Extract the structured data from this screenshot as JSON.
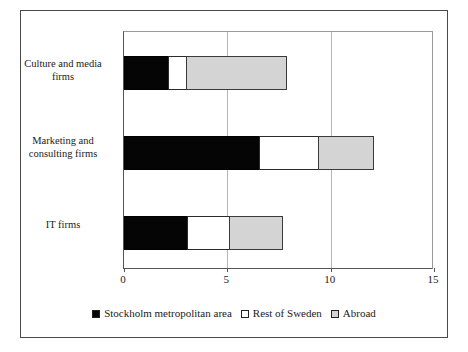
{
  "chart_data": {
    "type": "bar",
    "orientation": "horizontal",
    "stacked": true,
    "title": "",
    "xlabel": "",
    "ylabel": "",
    "xlim": [
      0,
      15
    ],
    "xticks": [
      0,
      5,
      10,
      15
    ],
    "xtick_labels": [
      "0",
      "5",
      "10",
      "15"
    ],
    "gridlines": [
      5,
      10
    ],
    "grid": true,
    "legend_position": "bottom",
    "categories": [
      "Culture and media firms",
      "Marketing and consulting firms",
      "IT firms"
    ],
    "category_lines": [
      [
        "Culture and media",
        "firms"
      ],
      [
        "Marketing and",
        "consulting firms"
      ],
      [
        "IT firms"
      ]
    ],
    "series": [
      {
        "name": "Stockholm metropolitan area",
        "color": "#050505",
        "values": [
          2.2,
          6.6,
          3.1
        ]
      },
      {
        "name": "Rest of Sweden",
        "color": "#ffffff",
        "values": [
          0.9,
          2.9,
          2.1
        ]
      },
      {
        "name": "Abroad",
        "color": "#d4d4d4",
        "values": [
          4.9,
          2.7,
          2.6
        ]
      }
    ],
    "totals": [
      8.0,
      12.2,
      7.8
    ]
  },
  "legend": {
    "items": [
      {
        "label": "Stockholm metropolitan area",
        "swatch": "swatch-black"
      },
      {
        "label": "Rest of Sweden",
        "swatch": "swatch-white"
      },
      {
        "label": "Abroad",
        "swatch": "swatch-gray"
      }
    ]
  }
}
